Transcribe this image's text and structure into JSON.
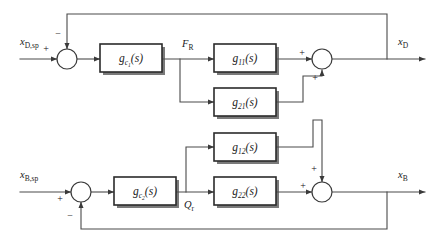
{
  "diagram": {
    "type": "control-block-diagram",
    "canvas": {
      "width": 437,
      "height": 241
    },
    "colors": {
      "background": "#ffffff",
      "wire": "#4a4a4a",
      "block_border": "#2b2b2b",
      "block_fill": "#ffffff",
      "shadow": "#4e4e4e",
      "text": "#1a1a1a"
    },
    "inputs": [
      {
        "id": "xdsp",
        "base": "x",
        "sub": "D,sp",
        "x": 20,
        "y": 45,
        "loop": "top"
      },
      {
        "id": "xbsp",
        "base": "x",
        "sub": "B,sp",
        "x": 20,
        "y": 178,
        "loop": "bottom"
      }
    ],
    "outputs": [
      {
        "id": "xd",
        "base": "x",
        "sub": "D",
        "x": 398,
        "y": 45,
        "loop": "top"
      },
      {
        "id": "xb",
        "base": "x",
        "sub": "B",
        "x": 398,
        "y": 178,
        "loop": "bottom"
      }
    ],
    "signals": [
      {
        "id": "fr",
        "base": "F",
        "sub": "R",
        "x": 182,
        "y": 47,
        "loop": "top"
      },
      {
        "id": "qr",
        "base": "Q",
        "sub": "r",
        "x": 184,
        "y": 208,
        "loop": "bottom"
      }
    ],
    "blocks": [
      {
        "id": "gc1",
        "base": "g",
        "sub": "c",
        "subsub": "1",
        "arg": "(s)",
        "x": 100,
        "y": 44,
        "w": 62,
        "h": 28,
        "role": "controller-top"
      },
      {
        "id": "g11",
        "base": "g",
        "sub": "11",
        "arg": "(s)",
        "x": 214,
        "y": 44,
        "w": 62,
        "h": 28,
        "role": "process-11"
      },
      {
        "id": "g21",
        "base": "g",
        "sub": "21",
        "arg": "(s)",
        "x": 214,
        "y": 88,
        "w": 62,
        "h": 28,
        "role": "process-21"
      },
      {
        "id": "g12",
        "base": "g",
        "sub": "12",
        "arg": "(s)",
        "x": 214,
        "y": 133,
        "w": 62,
        "h": 28,
        "role": "process-12"
      },
      {
        "id": "gc2",
        "base": "g",
        "sub": "c",
        "subsub": "2",
        "arg": "(s)",
        "x": 114,
        "y": 177,
        "w": 62,
        "h": 28,
        "role": "controller-bottom"
      },
      {
        "id": "g22",
        "base": "g",
        "sub": "22",
        "arg": "(s)",
        "x": 214,
        "y": 177,
        "w": 62,
        "h": 28,
        "role": "process-22"
      }
    ],
    "summers": [
      {
        "id": "sum-top-left",
        "cx": 67,
        "cy": 59,
        "r": 10,
        "role": "error-junction-top",
        "signs": [
          {
            "label": "+",
            "x": 46,
            "y": 52,
            "port": "left"
          },
          {
            "label": "−",
            "x": 58,
            "y": 37,
            "port": "top"
          }
        ]
      },
      {
        "id": "sum-top-right",
        "cx": 322,
        "cy": 59,
        "r": 10,
        "role": "output-junction-top",
        "signs": [
          {
            "label": "+",
            "x": 302,
            "y": 56,
            "port": "left"
          },
          {
            "label": "+",
            "x": 315,
            "y": 81,
            "port": "bottom"
          }
        ]
      },
      {
        "id": "sum-bottom-left",
        "cx": 81,
        "cy": 192,
        "r": 10,
        "role": "error-junction-bottom",
        "signs": [
          {
            "label": "+",
            "x": 60,
            "y": 202,
            "port": "left"
          },
          {
            "label": "−",
            "x": 70,
            "y": 219,
            "port": "bottom"
          }
        ]
      },
      {
        "id": "sum-bottom-right",
        "cx": 322,
        "cy": 192,
        "r": 10,
        "role": "output-junction-bottom",
        "signs": [
          {
            "label": "+",
            "x": 303,
            "y": 189,
            "port": "left"
          },
          {
            "label": "+",
            "x": 314,
            "y": 172,
            "port": "top"
          }
        ]
      }
    ],
    "wires": [
      {
        "id": "w-in-top",
        "d": "M 20 59 L 57 59",
        "arrow": "end",
        "desc": "xD,sp into top summer"
      },
      {
        "id": "w-sum1-gc1",
        "d": "M 77 59 L 100 59",
        "arrow": "end",
        "desc": "top error into gc1"
      },
      {
        "id": "w-gc1-fr",
        "d": "M 162 59 L 214 59",
        "arrow": "end",
        "desc": "gc1 output FR into g11"
      },
      {
        "id": "w-fr-branch",
        "d": "M 180 59 L 180 102 L 214 102",
        "arrow": "end",
        "desc": "FR branch into g21"
      },
      {
        "id": "w-g11-sum",
        "d": "M 276 59 L 312 59",
        "arrow": "end",
        "desc": "g11 into top right summer"
      },
      {
        "id": "w-sum-xd",
        "d": "M 332 59 L 425 59",
        "arrow": "end",
        "desc": "top summer to xD output"
      },
      {
        "id": "w-g21-up",
        "d": "M 276 102 L 303 102 L 303 76 L 322 76 L 322 70",
        "arrow": "end",
        "desc": "g21 output up into top summer bottom port"
      },
      {
        "id": "w-g12-down",
        "d": "M 276 147 L 313 147 L 313 120 L 322 120 L 322 182",
        "arrow": "end",
        "desc": "g12 output routed down into bottom summer top port"
      },
      {
        "id": "w-in-bottom",
        "d": "M 20 192 L 71 192",
        "arrow": "end",
        "desc": "xB,sp into bottom summer"
      },
      {
        "id": "w-sum2-gc2",
        "d": "M 91 192 L 114 192",
        "arrow": "end",
        "desc": "bottom error into gc2"
      },
      {
        "id": "w-gc2-qr",
        "d": "M 176 192 L 214 192",
        "arrow": "end",
        "desc": "gc2 output Qr into g22"
      },
      {
        "id": "w-qr-branch",
        "d": "M 186 192 L 186 147 L 214 147",
        "arrow": "end",
        "desc": "Qr branch up into g12"
      },
      {
        "id": "w-g22-sum",
        "d": "M 276 192 L 312 192",
        "arrow": "end",
        "desc": "g22 into bottom right summer"
      },
      {
        "id": "w-sum-xb",
        "d": "M 332 192 L 425 192",
        "arrow": "end",
        "desc": "bottom summer to xB output"
      },
      {
        "id": "w-fb-top",
        "d": "M 387 59 L 387 14 L 67 14 L 67 49",
        "arrow": "end",
        "desc": "xD feedback to top summer"
      },
      {
        "id": "w-fb-bottom",
        "d": "M 387 192 L 387 229 L 81 229 L 81 202",
        "arrow": "end",
        "desc": "xB feedback to bottom summer"
      }
    ]
  }
}
